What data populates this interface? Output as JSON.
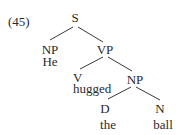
{
  "example_number": "(45)",
  "tree": {
    "root": {
      "label": "S"
    },
    "subject": {
      "label": "NP",
      "word": "He"
    },
    "predicate": {
      "label": "VP"
    },
    "verb": {
      "label": "V",
      "word": "hugged"
    },
    "object": {
      "label": "NP"
    },
    "determiner": {
      "label": "D",
      "word": "the"
    },
    "noun": {
      "label": "N",
      "word": "ball"
    }
  },
  "colors": {
    "text": "#2a2a2a",
    "line": "#3a3a3a",
    "background": "#ffffff"
  }
}
